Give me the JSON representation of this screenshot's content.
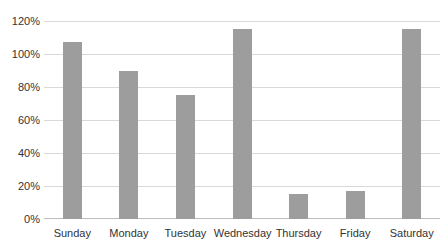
{
  "chart_data": {
    "type": "bar",
    "categories": [
      "Sunday",
      "Monday",
      "Tuesday",
      "Wednesday",
      "Thursday",
      "Friday",
      "Saturday"
    ],
    "values": [
      107,
      90,
      75,
      115,
      15,
      17,
      115
    ],
    "title": "",
    "xlabel": "",
    "ylabel": "",
    "ylim": [
      0,
      120
    ],
    "ytick_step": 20,
    "ytick_labels": [
      "0%",
      "20%",
      "40%",
      "60%",
      "80%",
      "100%",
      "120%"
    ],
    "grid": true,
    "legend_position": "none",
    "bar_color": "#9d9d9d",
    "gridline_color": "#d9d9d9",
    "axis_line_color": "#bcbcbc",
    "text_color": "#333333",
    "background": "#ffffff"
  }
}
